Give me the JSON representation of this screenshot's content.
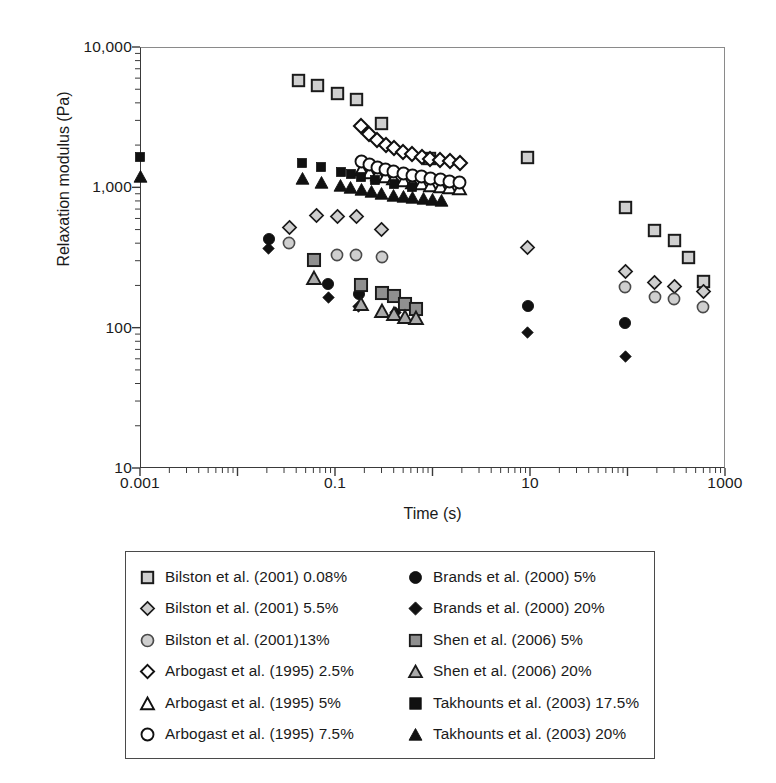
{
  "chart_data": {
    "type": "scatter",
    "title": "",
    "xlabel": "Time (s)",
    "ylabel": "Relaxation modulus (Pa)",
    "xscale": "log",
    "yscale": "log",
    "xlim": [
      0.001,
      1000
    ],
    "ylim": [
      10,
      10000
    ],
    "xticks": [
      0.001,
      0.1,
      10,
      1000
    ],
    "xtick_labels": [
      "0.001",
      "0.1",
      "10",
      "1000"
    ],
    "yticks": [
      10,
      100,
      1000,
      10000
    ],
    "ytick_labels": [
      "10",
      "100",
      "1,000",
      "10,000"
    ],
    "grid": false,
    "legend_position": "below-plot",
    "series": [
      {
        "name": "Bilston et al. (2001) 0.08%",
        "marker": "square-gray-light",
        "fill": "#cfcfcf",
        "edge": "#1a1a1a",
        "points": [
          [
            0.042,
            5800
          ],
          [
            0.066,
            5300
          ],
          [
            0.105,
            4700
          ],
          [
            0.165,
            4250
          ],
          [
            0.3,
            2850
          ],
          [
            0.93,
            1600
          ],
          [
            9.5,
            1620
          ],
          [
            95,
            720
          ],
          [
            190,
            490
          ],
          [
            300,
            420
          ],
          [
            420,
            315
          ],
          [
            600,
            215
          ]
        ]
      },
      {
        "name": "Bilston et al. (2001) 5.5%",
        "marker": "diamond-gray-light",
        "fill": "#cfcfcf",
        "edge": "#1a1a1a",
        "points": [
          [
            0.034,
            520
          ],
          [
            0.065,
            630
          ],
          [
            0.105,
            620
          ],
          [
            0.165,
            620
          ],
          [
            0.3,
            500
          ],
          [
            9.5,
            375
          ],
          [
            95,
            250
          ],
          [
            190,
            210
          ],
          [
            300,
            195
          ],
          [
            600,
            180
          ]
        ]
      },
      {
        "name": "Bilston et al. (2001)13%",
        "marker": "circle-gray-light",
        "fill": "#cfcfcf",
        "edge": "#4a4a4a",
        "points": [
          [
            0.034,
            400
          ],
          [
            0.105,
            330
          ],
          [
            0.165,
            330
          ],
          [
            0.3,
            320
          ],
          [
            95,
            195
          ],
          [
            190,
            165
          ],
          [
            300,
            160
          ],
          [
            600,
            140
          ]
        ]
      },
      {
        "name": "Arbogast et al. (1995) 2.5%",
        "marker": "diamond-open",
        "fill": "#ffffff",
        "edge": "#111111",
        "points": [
          [
            0.185,
            2750
          ],
          [
            0.225,
            2380
          ],
          [
            0.27,
            2180
          ],
          [
            0.33,
            2000
          ],
          [
            0.4,
            1900
          ],
          [
            0.5,
            1800
          ],
          [
            0.62,
            1720
          ],
          [
            0.78,
            1650
          ],
          [
            0.95,
            1600
          ],
          [
            1.2,
            1560
          ],
          [
            1.5,
            1530
          ],
          [
            1.9,
            1500
          ]
        ]
      },
      {
        "name": "Arbogast et al. (1995) 5%",
        "marker": "triangle-open",
        "fill": "#ffffff",
        "edge": "#111111",
        "points": [
          [
            0.185,
            1330
          ],
          [
            0.225,
            1270
          ],
          [
            0.27,
            1225
          ],
          [
            0.33,
            1190
          ],
          [
            0.4,
            1150
          ],
          [
            0.5,
            1115
          ],
          [
            0.62,
            1085
          ],
          [
            0.78,
            1060
          ],
          [
            0.95,
            1035
          ],
          [
            1.2,
            1015
          ],
          [
            1.5,
            1000
          ],
          [
            1.9,
            985
          ]
        ]
      },
      {
        "name": "Arbogast et al. (1995) 7.5%",
        "marker": "circle-open",
        "fill": "#ffffff",
        "edge": "#111111",
        "points": [
          [
            0.185,
            1520
          ],
          [
            0.225,
            1450
          ],
          [
            0.27,
            1395
          ],
          [
            0.33,
            1350
          ],
          [
            0.4,
            1300
          ],
          [
            0.5,
            1260
          ],
          [
            0.62,
            1220
          ],
          [
            0.78,
            1190
          ],
          [
            0.95,
            1160
          ],
          [
            1.2,
            1130
          ],
          [
            1.5,
            1105
          ],
          [
            1.9,
            1080
          ]
        ]
      },
      {
        "name": "Brands et al. (2000) 5%",
        "marker": "circle-filled",
        "fill": "#111111",
        "edge": "#111111",
        "points": [
          [
            0.021,
            430
          ],
          [
            0.085,
            205
          ],
          [
            0.175,
            175
          ],
          [
            9.5,
            143
          ],
          [
            95,
            108
          ]
        ]
      },
      {
        "name": "Brands et al. (2000) 20%",
        "marker": "diamond-filled",
        "fill": "#111111",
        "edge": "#111111",
        "points": [
          [
            0.021,
            365
          ],
          [
            0.085,
            163
          ],
          [
            0.175,
            142
          ],
          [
            0.42,
            128
          ],
          [
            9.5,
            92
          ],
          [
            95,
            62
          ]
        ]
      },
      {
        "name": "Shen et al. (2006) 5%",
        "marker": "square-gray-mid",
        "fill": "#999999",
        "edge": "#1a1a1a",
        "points": [
          [
            0.061,
            305
          ],
          [
            0.185,
            200
          ],
          [
            0.3,
            178
          ],
          [
            0.4,
            168
          ],
          [
            0.52,
            148
          ],
          [
            0.68,
            135
          ]
        ]
      },
      {
        "name": "Shen et al. (2006) 20%",
        "marker": "triangle-gray-mid",
        "fill": "#aaaaaa",
        "edge": "#1a1a1a",
        "points": [
          [
            0.061,
            225
          ],
          [
            0.185,
            148
          ],
          [
            0.3,
            132
          ],
          [
            0.4,
            126
          ],
          [
            0.52,
            120
          ],
          [
            0.68,
            118
          ]
        ]
      },
      {
        "name": "Takhounts et al. (2003) 17.5%",
        "marker": "square-filled",
        "fill": "#111111",
        "edge": "#111111",
        "points": [
          [
            0.001,
            1650
          ],
          [
            0.046,
            1480
          ],
          [
            0.072,
            1390
          ],
          [
            0.115,
            1290
          ],
          [
            0.145,
            1240
          ],
          [
            0.185,
            1190
          ],
          [
            0.26,
            1130
          ],
          [
            0.4,
            1060
          ],
          [
            0.62,
            1000
          ]
        ]
      },
      {
        "name": "Takhounts et al. (2003) 20%",
        "marker": "triangle-filled",
        "fill": "#111111",
        "edge": "#111111",
        "points": [
          [
            0.001,
            1200
          ],
          [
            0.046,
            1160
          ],
          [
            0.072,
            1090
          ],
          [
            0.115,
            1030
          ],
          [
            0.145,
            1000
          ],
          [
            0.185,
            965
          ],
          [
            0.235,
            935
          ],
          [
            0.3,
            905
          ],
          [
            0.4,
            880
          ],
          [
            0.5,
            860
          ],
          [
            0.62,
            845
          ],
          [
            0.8,
            830
          ],
          [
            1.0,
            815
          ],
          [
            1.25,
            800
          ]
        ]
      }
    ]
  },
  "axes": {
    "y_title": "Relaxation modulus (Pa)",
    "x_title": "Time (s)",
    "y_labels": [
      "10,000",
      "1,000",
      "100",
      "10"
    ],
    "x_labels": [
      "0.001",
      "0.1",
      "10",
      "1000"
    ]
  },
  "legend": {
    "column_left": [
      {
        "label": "Bilston et al. (2001) 0.08%",
        "marker": "square-gray-light"
      },
      {
        "label": "Bilston et al. (2001) 5.5%",
        "marker": "diamond-gray-light"
      },
      {
        "label": "Bilston et al. (2001)13%",
        "marker": "circle-gray-light"
      },
      {
        "label": "Arbogast et al. (1995) 2.5%",
        "marker": "diamond-open"
      },
      {
        "label": "Arbogast et al. (1995) 5%",
        "marker": "triangle-open"
      },
      {
        "label": "Arbogast et al. (1995) 7.5%",
        "marker": "circle-open"
      }
    ],
    "column_right": [
      {
        "label": "Brands et al. (2000) 5%",
        "marker": "circle-filled"
      },
      {
        "label": "Brands et al. (2000) 20%",
        "marker": "diamond-filled"
      },
      {
        "label": "Shen et al. (2006) 5%",
        "marker": "square-gray-mid"
      },
      {
        "label": "Shen et al. (2006) 20%",
        "marker": "triangle-gray-mid"
      },
      {
        "label": "Takhounts et al. (2003) 17.5%",
        "marker": "square-filled"
      },
      {
        "label": "Takhounts et al. (2003) 20%",
        "marker": "triangle-filled"
      }
    ]
  },
  "colors": {
    "gray_light": "#cfcfcf",
    "gray_mid": "#999999",
    "black": "#111111",
    "axis": "#3a3a3a"
  }
}
